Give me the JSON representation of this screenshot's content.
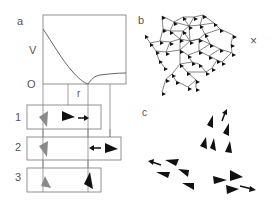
{
  "figure": {
    "panels": {
      "a": {
        "label": "a",
        "y_axis_label": "V",
        "origin_label": "O",
        "x_axis_label": "r",
        "row_labels": [
          "1",
          "2",
          "3"
        ]
      },
      "b": {
        "label": "b",
        "marker": "×"
      },
      "c": {
        "label": "c"
      }
    },
    "colors": {
      "line": "#555555",
      "agent_black": "#111111",
      "agent_gray": "#8a8a8a",
      "box": "#777777"
    }
  }
}
